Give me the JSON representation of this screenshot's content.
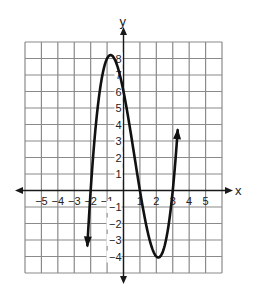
{
  "chart_data": {
    "type": "line",
    "title": "",
    "xlabel": "x",
    "ylabel": "y",
    "xlim": [
      -6,
      6
    ],
    "ylim": [
      -5,
      9
    ],
    "grid": true,
    "x_ticks": [
      -5,
      -4,
      -3,
      -2,
      -1,
      1,
      2,
      3,
      4,
      5
    ],
    "x_tick_labels": [
      "−5",
      "−4",
      "−3",
      "−2",
      "−1",
      "1",
      "2",
      "3",
      "4",
      "5"
    ],
    "y_ticks": [
      8,
      7,
      6,
      5,
      4,
      3,
      2,
      1,
      -1,
      -2,
      -3,
      -4
    ],
    "y_tick_labels": [
      "8",
      "7",
      "6",
      "5",
      "4",
      "3",
      "2",
      "1",
      "−1",
      "−2",
      "−3",
      "−4"
    ],
    "series": [
      {
        "name": "f(x)",
        "function": "(x+2)(x-1)(x-3)",
        "roots": [
          -2,
          1,
          3
        ],
        "local_max": [
          -0.79,
          8.21
        ],
        "local_min": [
          2.12,
          -4.06
        ],
        "domain_shown": [
          -2.2,
          3.3
        ],
        "arrows_at_ends": true,
        "color": "#111111"
      }
    ]
  }
}
